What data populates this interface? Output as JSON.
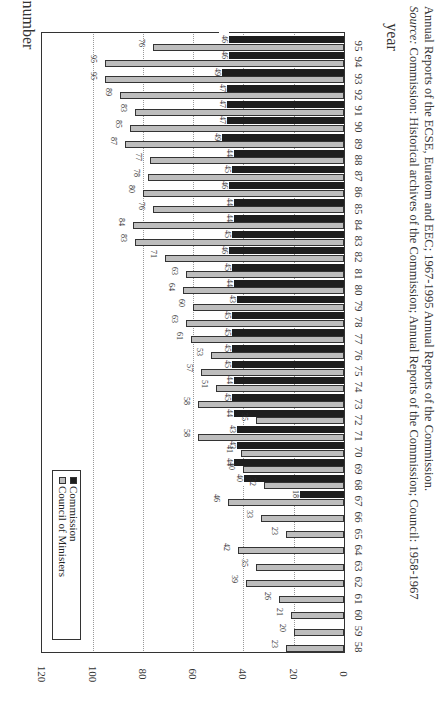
{
  "chart_data": {
    "type": "bar",
    "orientation": "horizontal bars, figure rotated 90 degrees clockwise",
    "title": "",
    "xlabel": "year",
    "ylabel": "number",
    "ylim": [
      0,
      120
    ],
    "yticks": [
      0,
      20,
      40,
      60,
      80,
      100,
      120
    ],
    "grid": true,
    "legend_position": "upper left (inside plot)",
    "categories": [
      "58",
      "59",
      "60",
      "61",
      "62",
      "63",
      "64",
      "65",
      "66",
      "67",
      "68",
      "69",
      "70",
      "71",
      "72",
      "73",
      "74",
      "75",
      "76",
      "77",
      "78",
      "79",
      "80",
      "81",
      "82",
      "83",
      "84",
      "85",
      "86",
      "87",
      "88",
      "89",
      "90",
      "91",
      "92",
      "93",
      "94",
      "95"
    ],
    "series": [
      {
        "name": "Council of Ministers",
        "color": "#bdbdbd",
        "values": [
          23,
          20,
          21,
          26,
          39,
          35,
          42,
          23,
          33,
          46,
          32,
          40,
          41,
          58,
          35,
          58,
          51,
          57,
          53,
          61,
          63,
          60,
          64,
          63,
          71,
          83,
          84,
          76,
          80,
          78,
          77,
          87,
          85,
          83,
          89,
          95,
          95,
          76
        ]
      },
      {
        "name": "Commission",
        "color": "#1e1e1e",
        "values": [
          null,
          null,
          null,
          null,
          null,
          null,
          null,
          null,
          null,
          18,
          40,
          44,
          43,
          43,
          44,
          45,
          44,
          45,
          45,
          45,
          45,
          43,
          44,
          45,
          46,
          45,
          44,
          44,
          46,
          45,
          44,
          49,
          47,
          47,
          47,
          49,
          46,
          46
        ]
      }
    ],
    "source_caption": {
      "label": "Source:",
      "line1": "Commission: Historical archives of the Commission; Annual Reports of the Commission; Council: 1958-1967",
      "line2": "Annual Reports of the ECSE, Euratom and EEC; 1967-1995 Annual Reports of the Commission."
    }
  },
  "legend": {
    "council": "Council of Ministers",
    "commission": "Commission"
  },
  "axes": {
    "y_title": "number",
    "x_title": "year"
  }
}
